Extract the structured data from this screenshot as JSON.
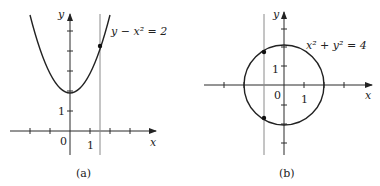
{
  "panel_a": {
    "caption": "(a)",
    "equation": "y − x² = 2",
    "x_axis_label": "x",
    "y_axis_label": "y",
    "origin_label": "0",
    "x_tick_label": "1",
    "y_tick_label": "1",
    "vertical_line_x": 1.5,
    "intersection_point": [
      1.5,
      4.25
    ]
  },
  "panel_b": {
    "caption": "(b)",
    "equation": "x² + y² = 4",
    "x_axis_label": "x",
    "y_axis_label": "y",
    "origin_label": "0",
    "x_tick_label": "1",
    "y_tick_label": "1",
    "vertical_line_x": -1,
    "intersection_points": [
      [
        -1,
        1.73
      ],
      [
        -1,
        -1.73
      ]
    ]
  }
}
